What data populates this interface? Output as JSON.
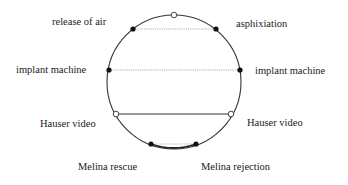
{
  "diagram": {
    "type": "circle-chord-diagram",
    "circle": {
      "cx": 174,
      "cy": 82,
      "r": 67,
      "stroke": "#333333"
    },
    "top_marker": {
      "x": 174,
      "y": 15,
      "style": "open"
    },
    "chords": [
      {
        "id": "release-asphixiation",
        "left": {
          "label": "release of air",
          "x": 133,
          "y": 29,
          "marker": "filled",
          "label_x": 80,
          "label_y": 25
        },
        "right": {
          "label": "asphixiation",
          "x": 216,
          "y": 29,
          "marker": "filled",
          "label_x": 236,
          "label_y": 25
        },
        "line_style": "dotted"
      },
      {
        "id": "implant-machine",
        "left": {
          "label": "implant machine",
          "x": 109,
          "y": 70,
          "marker": "filled",
          "label_x": 16,
          "label_y": 73
        },
        "right": {
          "label": "implant machine",
          "x": 240,
          "y": 70,
          "marker": "filled",
          "label_x": 255,
          "label_y": 74
        },
        "line_style": "dotted"
      },
      {
        "id": "hauser-video",
        "left": {
          "label": "Hauser video",
          "x": 116,
          "y": 114,
          "marker": "open",
          "label_x": 40,
          "label_y": 127
        },
        "right": {
          "label": "Hauser video",
          "x": 231,
          "y": 114,
          "marker": "open",
          "label_x": 247,
          "label_y": 126
        },
        "line_style": "solid"
      },
      {
        "id": "melina",
        "left": {
          "label": "Melina rescue",
          "x": 151,
          "y": 144,
          "marker": "filled",
          "label_x": 78,
          "label_y": 170
        },
        "right": {
          "label": "Melina rejection",
          "x": 196,
          "y": 144,
          "marker": "filled",
          "label_x": 201,
          "label_y": 170
        },
        "line_style": "dotted",
        "arc_emphasis": true
      }
    ],
    "labels": {
      "release_of_air": "release of air",
      "asphixiation": "asphixiation",
      "implant_machine_left": "implant machine",
      "implant_machine_right": "implant machine",
      "hauser_video_left": "Hauser video",
      "hauser_video_right": "Hauser video",
      "melina_rescue": "Melina rescue",
      "melina_rejection": "Melina rejection"
    }
  }
}
